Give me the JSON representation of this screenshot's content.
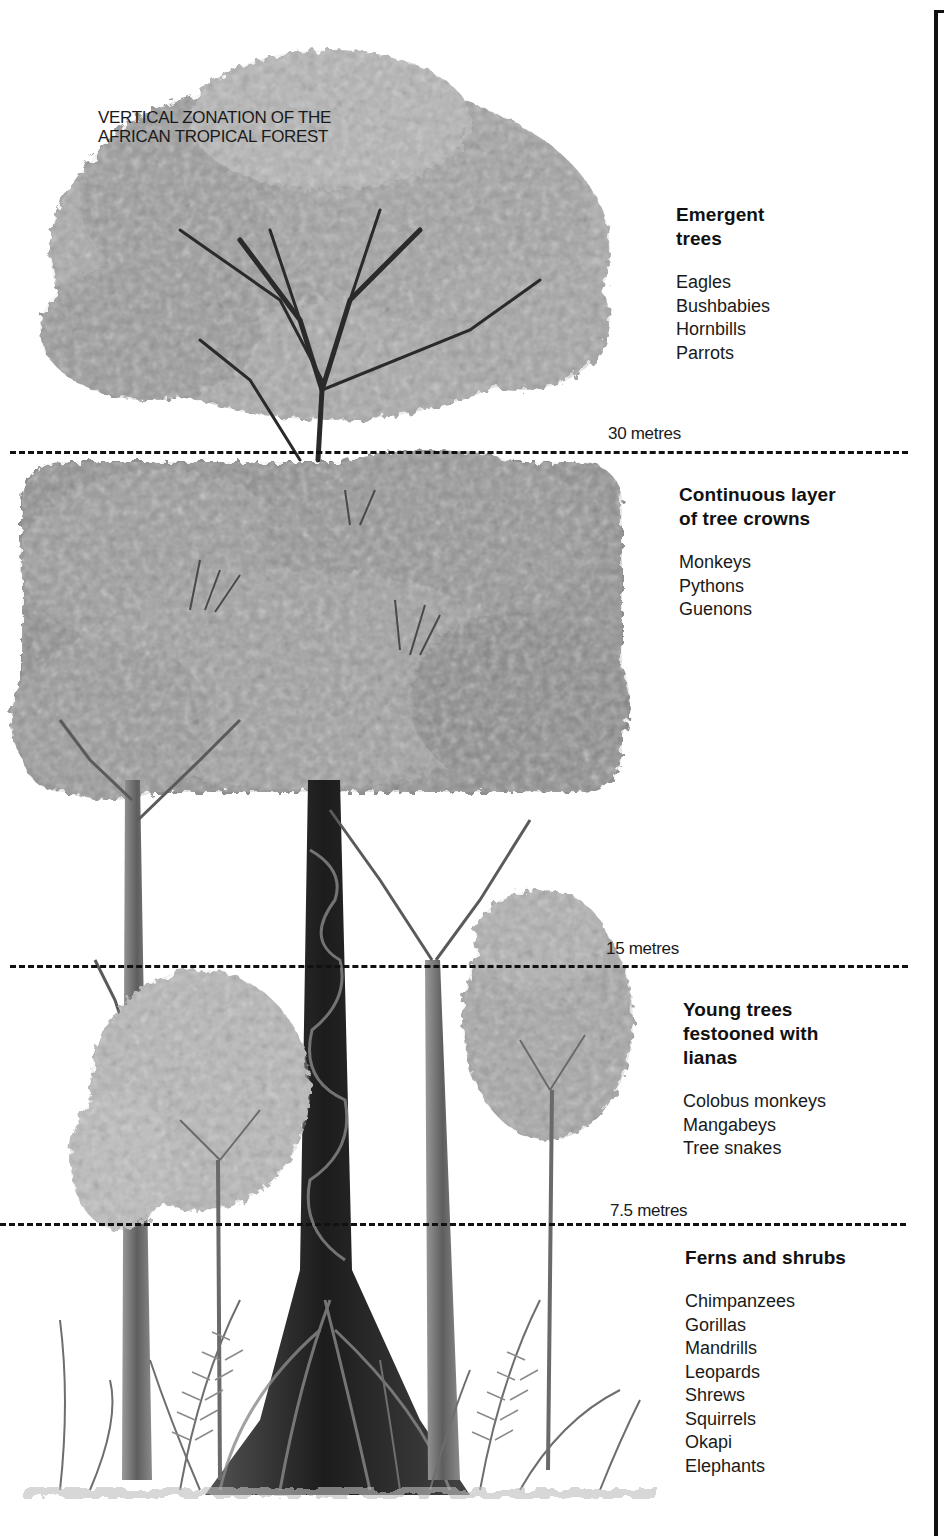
{
  "title": {
    "lines": [
      "VERTICAL ZONATION OF THE",
      "AFRICAN TROPICAL FOREST"
    ]
  },
  "height_markers": [
    {
      "label": "30 metres",
      "y": 452
    },
    {
      "label": "15 metres",
      "y": 967
    },
    {
      "label": "7.5 metres",
      "y": 1225
    }
  ],
  "zones": [
    {
      "name_lines": [
        "Emergent",
        "trees"
      ],
      "fauna": [
        "Eagles",
        "Bushbabies",
        "Hornbills",
        "Parrots"
      ]
    },
    {
      "name_lines": [
        "Continuous layer",
        "of tree crowns"
      ],
      "fauna": [
        "Monkeys",
        "Pythons",
        "Guenons"
      ]
    },
    {
      "name_lines": [
        "Young trees",
        "festooned with",
        "lianas"
      ],
      "fauna": [
        "Colobus monkeys",
        "Mangabeys",
        "Tree snakes"
      ]
    },
    {
      "name_lines": [
        "Ferns and shrubs"
      ],
      "fauna": [
        "Chimpanzees",
        "Gorillas",
        "Mandrills",
        "Leopards",
        "Shrews",
        "Squirrels",
        "Okapi",
        "Elephants"
      ]
    }
  ],
  "colors": {
    "ink": "#111111",
    "foliage_light": "#b8b8b8",
    "foliage_mid": "#8c8c8c",
    "foliage_dark": "#5a5a5a",
    "trunk": "#2a2a2a"
  }
}
